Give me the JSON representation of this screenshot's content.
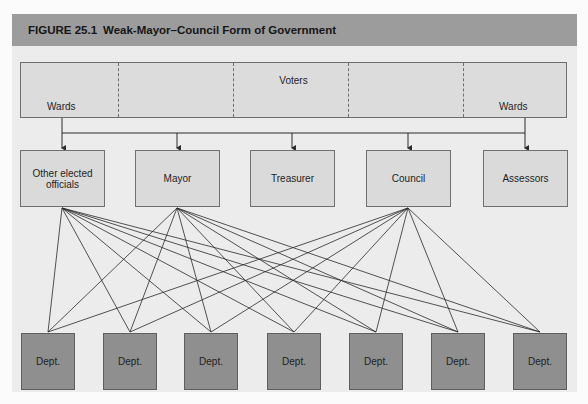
{
  "figure": {
    "number": "FIGURE 25.1",
    "title": "Weak-Mayor–Council Form of Government"
  },
  "voters": {
    "label": "Voters",
    "wards_left": "Wards",
    "wards_right": "Wards",
    "segments": 5
  },
  "offices": [
    {
      "id": "other",
      "label": "Other elected officials"
    },
    {
      "id": "mayor",
      "label": "Mayor"
    },
    {
      "id": "treasurer",
      "label": "Treasurer"
    },
    {
      "id": "council",
      "label": "Council"
    },
    {
      "id": "assessors",
      "label": "Assessors"
    }
  ],
  "departments": [
    {
      "label": "Dept."
    },
    {
      "label": "Dept."
    },
    {
      "label": "Dept."
    },
    {
      "label": "Dept."
    },
    {
      "label": "Dept."
    },
    {
      "label": "Dept."
    },
    {
      "label": "Dept."
    }
  ],
  "connections": {
    "voters_to_offices": [
      "other",
      "mayor",
      "treasurer",
      "council",
      "assessors"
    ],
    "offices_to_all_departments": [
      "other",
      "mayor",
      "council"
    ]
  },
  "colors": {
    "header": "#9c9c9c",
    "panel": "#ececec",
    "office_box": "#dadada",
    "dept_box": "#8f8f8f",
    "line": "#2a2a2a"
  }
}
